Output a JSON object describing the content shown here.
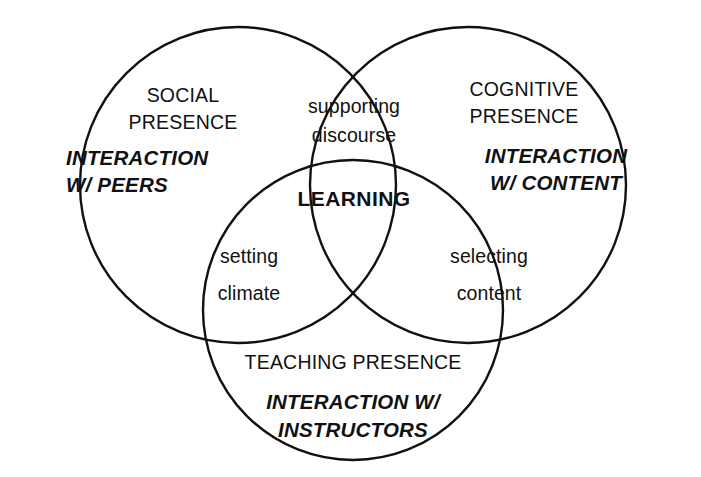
{
  "diagram": {
    "type": "venn-3-circle",
    "background_color": "#ffffff",
    "stroke_color": "#111111",
    "text_color": "#111111"
  },
  "circles": [
    {
      "id": "social",
      "name": "social-presence-circle",
      "cx": 238,
      "cy": 185,
      "r": 158
    },
    {
      "id": "cognitive",
      "name": "cognitive-presence-circle",
      "cx": 468,
      "cy": 185,
      "r": 158
    },
    {
      "id": "teaching",
      "name": "teaching-presence-circle",
      "cx": 353,
      "cy": 310,
      "r": 150
    }
  ],
  "regions": {
    "social": {
      "heading_line1": "SOCIAL",
      "heading_line2": "PRESENCE",
      "emphasis_line1": "INTERACTION",
      "emphasis_line2": "W/ PEERS"
    },
    "cognitive": {
      "heading_line1": "COGNITIVE",
      "heading_line2": "PRESENCE",
      "emphasis_line1": "INTERACTION",
      "emphasis_line2": "W/ CONTENT"
    },
    "teaching": {
      "heading_line1": "TEACHING PRESENCE",
      "emphasis_line1": "INTERACTION W/",
      "emphasis_line2": "INSTRUCTORS"
    },
    "social_cognitive_overlap": {
      "line1": "supporting",
      "line2": "discourse"
    },
    "social_teaching_overlap": {
      "line1": "setting",
      "line2": "climate"
    },
    "cognitive_teaching_overlap": {
      "line1": "selecting",
      "line2": "content"
    },
    "center": {
      "label": "LEARNING"
    }
  }
}
